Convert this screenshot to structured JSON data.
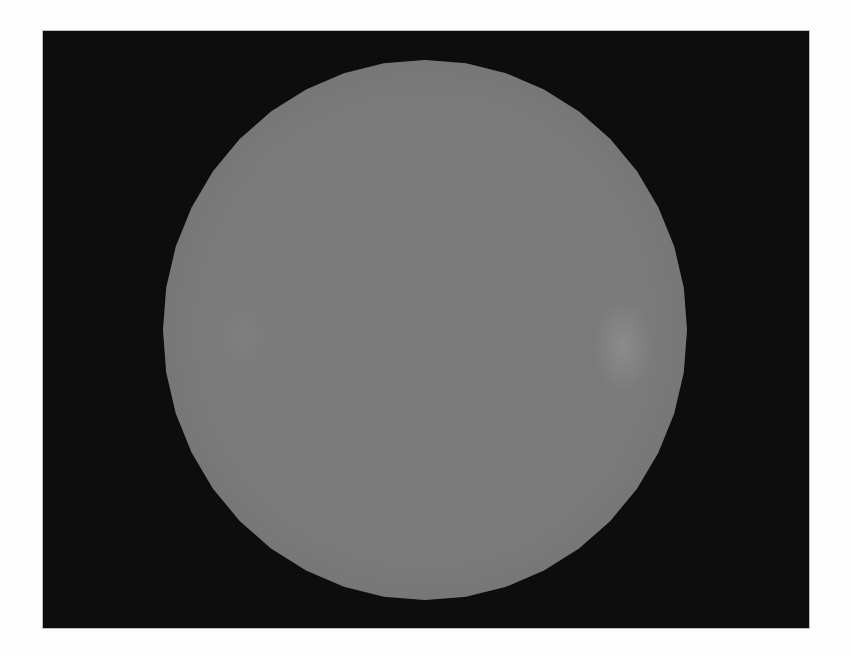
{
  "scene": {
    "description": "Rendered gray sphere on black background",
    "background_color": "#0f0f0f",
    "page_color": "#fdfdfd",
    "sphere": {
      "fill_color": "#7b7b7b",
      "highlight_color": "#8e8e8e",
      "shadow_color": "#727272",
      "center_x": 382,
      "center_y": 299,
      "radius_x": 262,
      "radius_y": 270,
      "facets": 40
    }
  }
}
